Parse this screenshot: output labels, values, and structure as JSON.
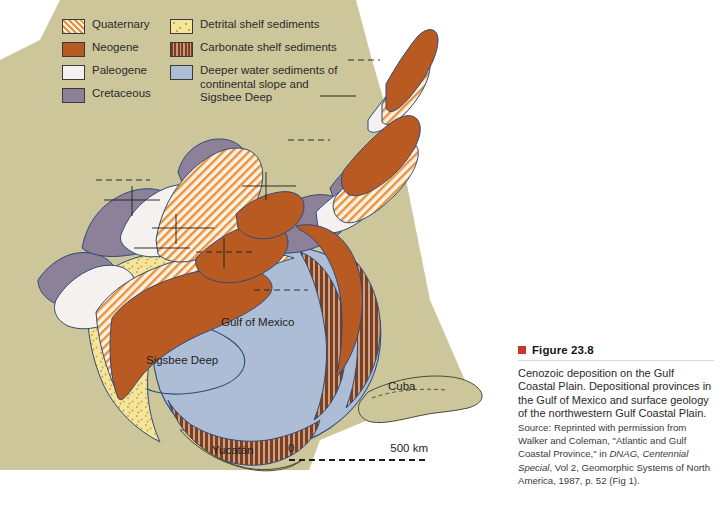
{
  "figure": {
    "marker_color": "#c0392b",
    "number_label": "Figure 23.8",
    "caption_main": "Cenozoic deposition on the Gulf Coastal Plain. Depositional provinces in the Gulf of Mexico and surface geology of the northwestern Gulf Coastal Plain.",
    "source_prefix": "Source:",
    "source_text_1": "Reprinted with permission from Walker and Coleman, \"Atlantic and Gulf Coastal Province,\" in ",
    "source_italic_1": "DNAG, Centennial Special",
    "source_text_2": ", Vol 2, Geomorphic Systems of North America, 1987, p. 52 (Fig 1)."
  },
  "legend": {
    "left_column": [
      {
        "label": "Quaternary",
        "swatch": "sw-quaternary",
        "color": "#e8913f"
      },
      {
        "label": "Neogene",
        "swatch": "sw-neogene",
        "color": "#ba5a23"
      },
      {
        "label": "Paleogene",
        "swatch": "sw-paleogene",
        "color": "#f4f1ee"
      },
      {
        "label": "Cretaceous",
        "swatch": "sw-cretaceous",
        "color": "#8d8099"
      }
    ],
    "right_column": [
      {
        "label": "Detrital shelf sediments",
        "swatch": "sw-detrital",
        "color": "#f5e49b"
      },
      {
        "label": "Carbonate shelf sediments",
        "swatch": "sw-carbonate",
        "color": "#7d3f22"
      },
      {
        "label": "Deeper water sediments of\ncontinental slope and\nSigsbee Deep",
        "swatch": "sw-deeper",
        "color": "#aebdd6"
      }
    ]
  },
  "map": {
    "background_color": "#cdc69b",
    "water_color": "#aebdd6",
    "land_color": "#cdc69b",
    "labels": {
      "gulf_of_mexico": "Gulf of Mexico",
      "sigsbee_deep": "Sigsbee Deep",
      "cuba": "Cuba",
      "yucatan": "Yucatán"
    },
    "scale": {
      "zero": "0",
      "max": "500 km"
    }
  }
}
